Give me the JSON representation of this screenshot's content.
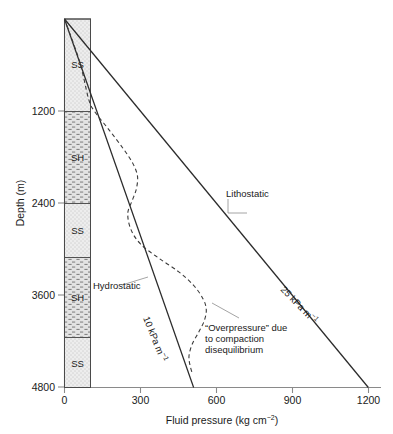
{
  "chart_data": {
    "type": "line",
    "title": "",
    "xlabel": "Fluid pressure (kg cm⁻²)",
    "ylabel": "Depth (m)",
    "xlabel_main": "Fluid pressure (kg cm",
    "xlabel_sup": "−2",
    "xlabel_tail": ")",
    "ylabel_text": "Depth (m)",
    "xlim": [
      0,
      1250
    ],
    "ylim": [
      0,
      4800
    ],
    "y_inverted": true,
    "grid": false,
    "legend": "none",
    "xticks": [
      0,
      300,
      600,
      900,
      1200
    ],
    "xticklabels": [
      "0",
      "300",
      "600",
      "900",
      "1200"
    ],
    "yticks": [
      1200,
      2400,
      3600,
      4800
    ],
    "yticklabels": [
      "1200",
      "2400",
      "3600",
      "4800"
    ],
    "series": [
      {
        "name": "Lithostatic",
        "style": "solid",
        "gradient_label": "25 kPa m",
        "gradient_sup": "−1",
        "points": [
          [
            0,
            0
          ],
          [
            1200,
            4800
          ]
        ]
      },
      {
        "name": "Hydrostatic",
        "style": "solid",
        "gradient_label": "10 kPa m",
        "gradient_sup": "−1",
        "points": [
          [
            0,
            0
          ],
          [
            510,
            4800
          ]
        ]
      },
      {
        "name": "Overpressure",
        "style": "dashed",
        "points": [
          [
            0,
            0
          ],
          [
            60,
            560
          ],
          [
            95,
            1040
          ],
          [
            118,
            1200
          ],
          [
            175,
            1440
          ],
          [
            230,
            1680
          ],
          [
            268,
            1870
          ],
          [
            288,
            2040
          ],
          [
            284,
            2210
          ],
          [
            268,
            2360
          ],
          [
            250,
            2530
          ],
          [
            262,
            2740
          ],
          [
            300,
            2930
          ],
          [
            370,
            3110
          ],
          [
            450,
            3290
          ],
          [
            510,
            3470
          ],
          [
            548,
            3650
          ],
          [
            560,
            3790
          ],
          [
            552,
            3930
          ],
          [
            530,
            4080
          ],
          [
            505,
            4230
          ],
          [
            492,
            4380
          ],
          [
            495,
            4500
          ],
          [
            505,
            4620
          ]
        ]
      }
    ],
    "annotations": [
      {
        "name": "lithostatic-label",
        "text": "Lithostatic"
      },
      {
        "name": "hydrostatic-label",
        "text": "Hydrostatic"
      },
      {
        "name": "overpressure-line1",
        "text": "“Overpressure” due"
      },
      {
        "name": "overpressure-line2",
        "text": "to compaction"
      },
      {
        "name": "overpressure-line3",
        "text": "disequilibrium"
      }
    ],
    "lithology_column": {
      "label": "lithology log",
      "units": [
        {
          "code": "SS",
          "rock": "sandstone",
          "top": 0,
          "base": 1200,
          "pattern": "stipple"
        },
        {
          "code": "SH",
          "rock": "shale",
          "top": 1200,
          "base": 2400,
          "pattern": "dash"
        },
        {
          "code": "SS",
          "rock": "sandstone",
          "top": 2400,
          "base": 3100,
          "pattern": "stipple"
        },
        {
          "code": "SH",
          "rock": "shale",
          "top": 3100,
          "base": 4150,
          "pattern": "dash"
        },
        {
          "code": "SS",
          "rock": "sandstone",
          "top": 4150,
          "base": 4800,
          "pattern": "stipple"
        }
      ]
    },
    "colors": {
      "line": "#2b2b2b",
      "axis": "#8a8a8a",
      "text": "#1a1a1a",
      "lith_fill": "#ededed",
      "leader": "#9a9a9a"
    }
  }
}
